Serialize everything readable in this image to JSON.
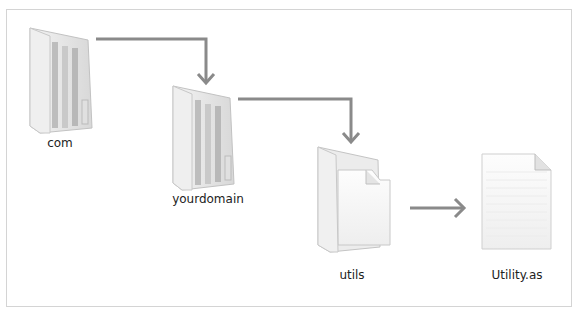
{
  "diagram": {
    "type": "folder-hierarchy",
    "nodes": [
      {
        "id": "com",
        "label": "com",
        "kind": "folder"
      },
      {
        "id": "yourdomain",
        "label": "yourdomain",
        "kind": "folder"
      },
      {
        "id": "utils",
        "label": "utils",
        "kind": "folder-open"
      },
      {
        "id": "utility",
        "label": "Utility.as",
        "kind": "file"
      }
    ],
    "edges": [
      {
        "from": "com",
        "to": "yourdomain"
      },
      {
        "from": "yourdomain",
        "to": "utils"
      },
      {
        "from": "utils",
        "to": "utility"
      }
    ],
    "colors": {
      "arrow": "#8a8a8a",
      "border": "#d4d4d4",
      "folder": "#e9e9e9",
      "folder_shade": "#c8c8c8"
    }
  }
}
